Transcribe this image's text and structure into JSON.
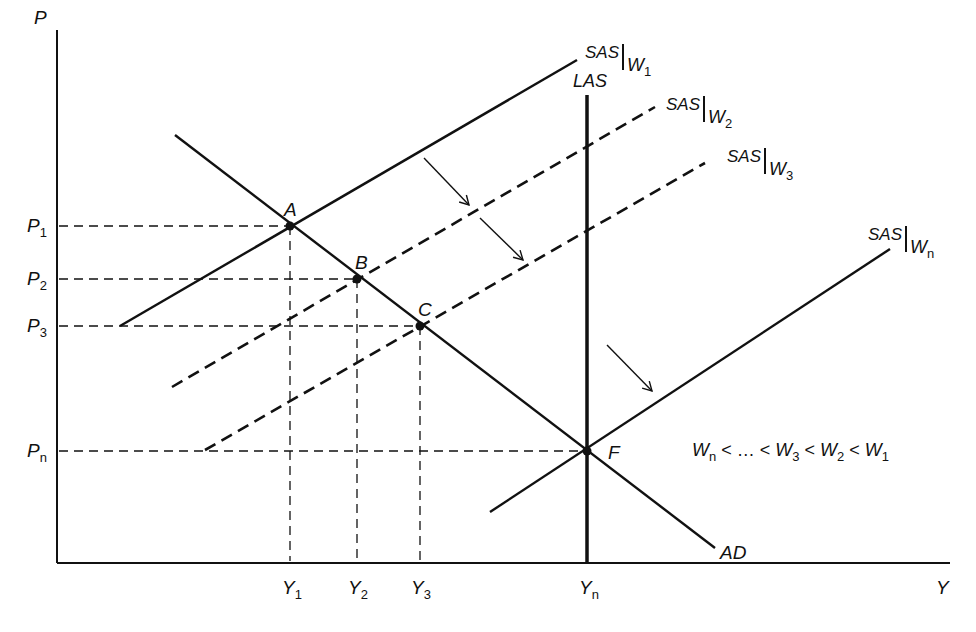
{
  "axes": {
    "y_label": "P",
    "x_label": "Y"
  },
  "price_levels": [
    {
      "name": "P",
      "sub": "1",
      "y": 226
    },
    {
      "name": "P",
      "sub": "2",
      "y": 279
    },
    {
      "name": "P",
      "sub": "3",
      "y": 326
    },
    {
      "name": "P",
      "sub": "n",
      "y": 451
    }
  ],
  "output_levels": [
    {
      "name": "Y",
      "sub": "1",
      "x": 290
    },
    {
      "name": "Y",
      "sub": "2",
      "x": 357
    },
    {
      "name": "Y",
      "sub": "3",
      "x": 420
    },
    {
      "name": "Y",
      "sub": "n",
      "x": 587
    }
  ],
  "points": [
    {
      "label": "A",
      "x": 290,
      "y": 226
    },
    {
      "label": "B",
      "x": 357,
      "y": 279
    },
    {
      "label": "C",
      "x": 420,
      "y": 326
    },
    {
      "label": "F",
      "x": 587,
      "y": 451
    }
  ],
  "curves": {
    "ad": {
      "label": "AD"
    },
    "las": {
      "label": "LAS"
    },
    "sas_w1": {
      "main": "SAS",
      "w": "W",
      "sub": "1"
    },
    "sas_w2": {
      "main": "SAS",
      "w": "W",
      "sub": "2"
    },
    "sas_w3": {
      "main": "SAS",
      "w": "W",
      "sub": "3"
    },
    "sas_wn": {
      "main": "SAS",
      "w": "W",
      "sub": "n"
    }
  },
  "inequality": {
    "w": "W",
    "s_n": "n",
    "lt1": " < … < ",
    "s_3": "3",
    "lt2": " < ",
    "s_2": "2",
    "lt3": " < ",
    "s_1": "1"
  },
  "colors": {
    "ink": "#111111",
    "background": "#ffffff"
  }
}
